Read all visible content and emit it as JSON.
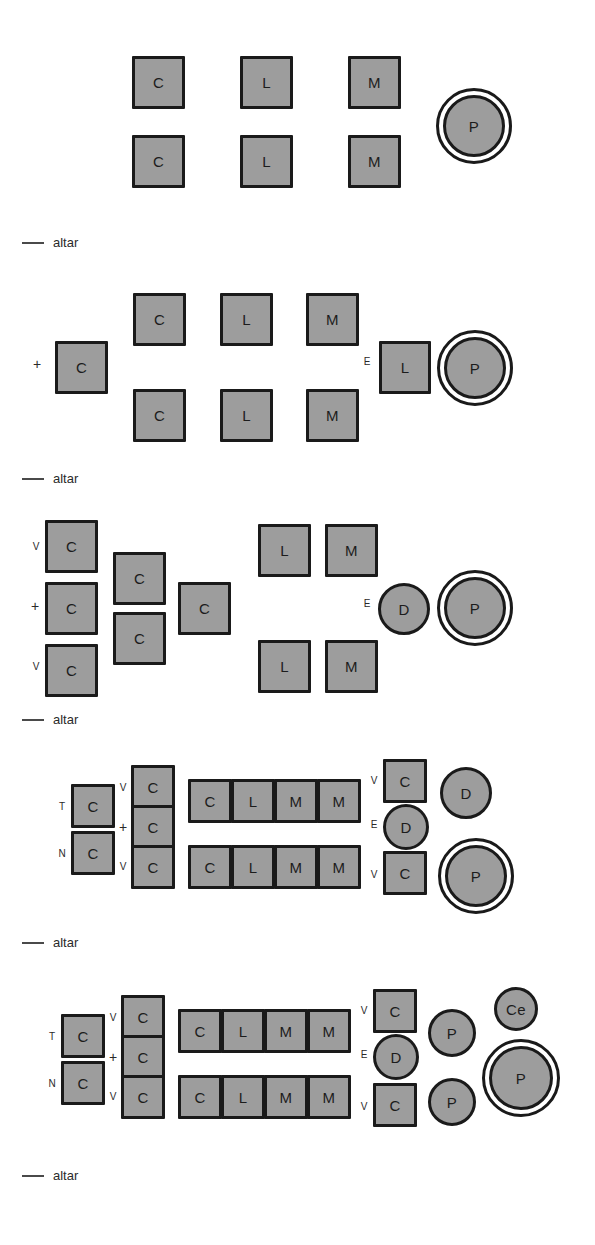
{
  "figure": {
    "kind": "architectural-plan-evolution-diagram",
    "background_color": "#ffffff",
    "shape_fill_color": "#9d9d9d",
    "shape_stroke_color": "#1a1a1a",
    "text_color": "#1c1c1c",
    "legend_label": "altar",
    "legend_count": 5
  },
  "legend": {
    "altar_label": "altar"
  },
  "stages": [
    {
      "id": "stage-1",
      "annotations": [],
      "shapes": [
        {
          "label": "C",
          "kind": "square",
          "row": "top"
        },
        {
          "label": "L",
          "kind": "square",
          "row": "top"
        },
        {
          "label": "M",
          "kind": "square",
          "row": "top"
        },
        {
          "label": "C",
          "kind": "square",
          "row": "bottom"
        },
        {
          "label": "L",
          "kind": "square",
          "row": "bottom"
        },
        {
          "label": "M",
          "kind": "square",
          "row": "bottom"
        },
        {
          "label": "P",
          "kind": "double-ring-circle",
          "row": "middle"
        }
      ]
    },
    {
      "id": "stage-2",
      "annotations": [
        "+",
        "E"
      ],
      "shapes": [
        {
          "label": "C",
          "kind": "square",
          "row": "middle",
          "annotation": "+"
        },
        {
          "label": "C",
          "kind": "square",
          "row": "top"
        },
        {
          "label": "L",
          "kind": "square",
          "row": "top"
        },
        {
          "label": "M",
          "kind": "square",
          "row": "top"
        },
        {
          "label": "C",
          "kind": "square",
          "row": "bottom"
        },
        {
          "label": "L",
          "kind": "square",
          "row": "bottom"
        },
        {
          "label": "M",
          "kind": "square",
          "row": "bottom"
        },
        {
          "label": "L",
          "kind": "square",
          "row": "middle",
          "annotation": "E"
        },
        {
          "label": "P",
          "kind": "double-ring-circle",
          "row": "middle"
        }
      ]
    },
    {
      "id": "stage-3",
      "annotations": [
        "V",
        "+",
        "V",
        "E"
      ],
      "shapes": [
        {
          "label": "C",
          "kind": "square",
          "row": "top",
          "annotation": "V"
        },
        {
          "label": "C",
          "kind": "square",
          "row": "middle",
          "annotation": "+"
        },
        {
          "label": "C",
          "kind": "square",
          "row": "bottom",
          "annotation": "V"
        },
        {
          "label": "C",
          "kind": "square",
          "row": "upper-mid"
        },
        {
          "label": "C",
          "kind": "square",
          "row": "lower-mid"
        },
        {
          "label": "C",
          "kind": "square",
          "row": "middle"
        },
        {
          "label": "L",
          "kind": "square",
          "row": "top"
        },
        {
          "label": "M",
          "kind": "square",
          "row": "top"
        },
        {
          "label": "L",
          "kind": "square",
          "row": "bottom"
        },
        {
          "label": "M",
          "kind": "square",
          "row": "bottom"
        },
        {
          "label": "D",
          "kind": "circle",
          "row": "middle",
          "annotation": "E"
        },
        {
          "label": "P",
          "kind": "double-ring-circle",
          "row": "middle"
        }
      ]
    },
    {
      "id": "stage-4",
      "annotations": [
        "T",
        "N",
        "V",
        "+",
        "V",
        "V",
        "E",
        "V"
      ],
      "shapes": [
        {
          "label": "C",
          "kind": "square",
          "row": "top",
          "annotation": "T"
        },
        {
          "label": "C",
          "kind": "square",
          "row": "bottom",
          "annotation": "N"
        },
        {
          "label": "C",
          "kind": "square",
          "row": "top",
          "annotation": "V"
        },
        {
          "label": "C",
          "kind": "square",
          "row": "middle",
          "annotation": "+"
        },
        {
          "label": "C",
          "kind": "square",
          "row": "bottom",
          "annotation": "V"
        },
        {
          "label": "C",
          "kind": "square",
          "row": "top"
        },
        {
          "label": "L",
          "kind": "square",
          "row": "top"
        },
        {
          "label": "M",
          "kind": "square",
          "row": "top"
        },
        {
          "label": "M",
          "kind": "square",
          "row": "top"
        },
        {
          "label": "C",
          "kind": "square",
          "row": "bottom"
        },
        {
          "label": "L",
          "kind": "square",
          "row": "bottom"
        },
        {
          "label": "M",
          "kind": "square",
          "row": "bottom"
        },
        {
          "label": "M",
          "kind": "square",
          "row": "bottom"
        },
        {
          "label": "C",
          "kind": "square",
          "row": "top",
          "annotation": "V"
        },
        {
          "label": "D",
          "kind": "circle",
          "row": "middle",
          "annotation": "E"
        },
        {
          "label": "C",
          "kind": "square",
          "row": "bottom",
          "annotation": "V"
        },
        {
          "label": "D",
          "kind": "circle",
          "row": "top"
        },
        {
          "label": "P",
          "kind": "double-ring-circle",
          "row": "bottom"
        }
      ]
    },
    {
      "id": "stage-5",
      "annotations": [
        "T",
        "N",
        "V",
        "+",
        "V",
        "V",
        "E",
        "V"
      ],
      "shapes": [
        {
          "label": "C",
          "kind": "square",
          "row": "top",
          "annotation": "T"
        },
        {
          "label": "C",
          "kind": "square",
          "row": "bottom",
          "annotation": "N"
        },
        {
          "label": "C",
          "kind": "square",
          "row": "top",
          "annotation": "V"
        },
        {
          "label": "C",
          "kind": "square",
          "row": "middle",
          "annotation": "+"
        },
        {
          "label": "C",
          "kind": "square",
          "row": "bottom",
          "annotation": "V"
        },
        {
          "label": "C",
          "kind": "square",
          "row": "top"
        },
        {
          "label": "L",
          "kind": "square",
          "row": "top"
        },
        {
          "label": "M",
          "kind": "square",
          "row": "top"
        },
        {
          "label": "M",
          "kind": "square",
          "row": "top"
        },
        {
          "label": "C",
          "kind": "square",
          "row": "bottom"
        },
        {
          "label": "L",
          "kind": "square",
          "row": "bottom"
        },
        {
          "label": "M",
          "kind": "square",
          "row": "bottom"
        },
        {
          "label": "M",
          "kind": "square",
          "row": "bottom"
        },
        {
          "label": "C",
          "kind": "square",
          "row": "top",
          "annotation": "V"
        },
        {
          "label": "D",
          "kind": "circle",
          "row": "middle",
          "annotation": "E"
        },
        {
          "label": "C",
          "kind": "square",
          "row": "bottom",
          "annotation": "V"
        },
        {
          "label": "P",
          "kind": "circle",
          "row": "top"
        },
        {
          "label": "P",
          "kind": "circle",
          "row": "bottom"
        },
        {
          "label": "Ce",
          "kind": "circle",
          "row": "top"
        },
        {
          "label": "P",
          "kind": "double-ring-circle",
          "row": "middle"
        }
      ]
    }
  ],
  "labels": {
    "C": "C",
    "L": "L",
    "M": "M",
    "P": "P",
    "D": "D",
    "Ce": "Ce",
    "V": "V",
    "T": "T",
    "N": "N",
    "E": "E",
    "plus": "+",
    "altar": "altar"
  }
}
